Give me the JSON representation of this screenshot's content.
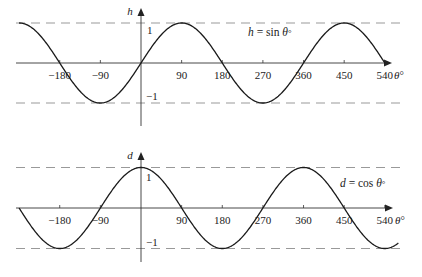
{
  "chart_data": [
    {
      "type": "line",
      "title": "",
      "function": "sin",
      "equation_label": "h = sin θ°",
      "equation_parts": {
        "lhs": "h",
        "eq": " = sin ",
        "var": "θ",
        "deg": "°"
      },
      "xlabel": "θ°",
      "ylabel": "h",
      "xlim": [
        -270,
        540
      ],
      "ylim": [
        -1,
        1
      ],
      "x_ticks": [
        -180,
        -90,
        90,
        180,
        270,
        360,
        450,
        540
      ],
      "x_tick_labels": [
        "−180",
        "−90",
        "90",
        "180",
        "270",
        "360",
        "450",
        "540"
      ],
      "y_tick_labels": {
        "top": "1",
        "bottom": "−1"
      },
      "dashed_guides": [
        1,
        -1
      ],
      "series": [
        {
          "name": "h = sin θ°",
          "x": [
            -270,
            -180,
            -90,
            0,
            90,
            180,
            270,
            360,
            450,
            540
          ],
          "values": [
            1,
            0,
            -1,
            0,
            1,
            0,
            -1,
            0,
            1,
            0
          ]
        }
      ],
      "grid": false
    },
    {
      "type": "line",
      "title": "",
      "function": "cos",
      "equation_label": "d = cos θ°",
      "equation_parts": {
        "lhs": "d",
        "eq": " = cos ",
        "var": "θ",
        "deg": "°"
      },
      "xlabel": "θ°",
      "ylabel": "d",
      "xlim": [
        -270,
        570
      ],
      "ylim": [
        -1,
        1
      ],
      "x_ticks": [
        -180,
        -90,
        90,
        180,
        270,
        360,
        450,
        540
      ],
      "x_tick_labels": [
        "−180",
        "−90",
        "90",
        "180",
        "270",
        "360",
        "450",
        "540"
      ],
      "y_tick_labels": {
        "top": "1",
        "bottom": "−1"
      },
      "dashed_guides": [
        1,
        -1
      ],
      "series": [
        {
          "name": "d = cos θ°",
          "x": [
            -270,
            -180,
            -90,
            0,
            90,
            180,
            270,
            360,
            450,
            540
          ],
          "values": [
            0,
            -1,
            0,
            1,
            0,
            -1,
            0,
            1,
            0,
            -1
          ]
        }
      ],
      "grid": false
    }
  ]
}
